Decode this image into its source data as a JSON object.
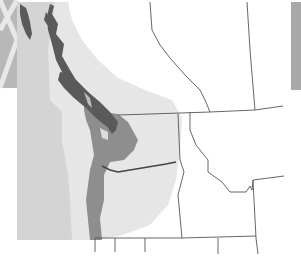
{
  "map": {
    "type": "regional range map",
    "region": "Pacific Northwest",
    "colors": {
      "background": "#ffffff",
      "ocean": "#cfcfcf",
      "outer_range": "#e6e6e6",
      "core_range": "#8e8e8e",
      "dense_range": "#5a5a5a",
      "border_lines": "#555555",
      "edge_panel_left": "#b8b8b8",
      "edge_panel_right": "#a8a8a8"
    },
    "labels": []
  }
}
